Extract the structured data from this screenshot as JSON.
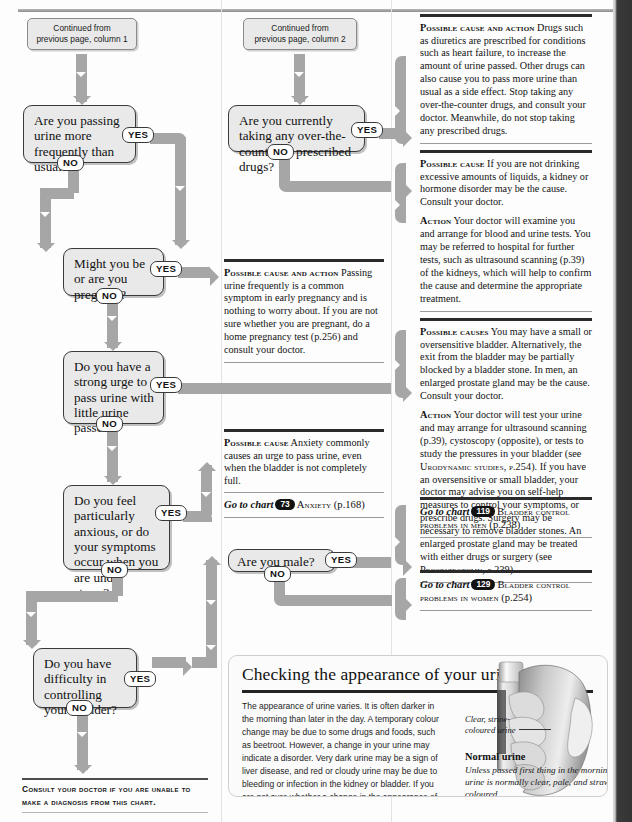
{
  "page": {
    "footer_note_line1": "Consult your doctor if you are unable to",
    "footer_note_line2": "make a diagnosis from this chart."
  },
  "continued": [
    {
      "name": "continued-column-1",
      "line1": "Continued from",
      "line2": "previous page, column 1"
    },
    {
      "name": "continued-column-2",
      "line1": "Continued from",
      "line2": "previous page, column 2"
    }
  ],
  "questions": [
    {
      "id": "q-frequency",
      "text": "Are you passing urine more frequently than usual?",
      "yes": "YES",
      "no": "NO"
    },
    {
      "id": "q-drugs",
      "text": "Are you currently taking any over-the-counter or prescribed drugs?",
      "yes": "YES",
      "no": "NO"
    },
    {
      "id": "q-pregnant",
      "text": "Might you be or are you pregnant?",
      "yes": "YES",
      "no": "NO"
    },
    {
      "id": "q-urge",
      "text": "Do you have a strong urge to pass urine with little urine passed?",
      "yes": "YES",
      "no": "NO"
    },
    {
      "id": "q-anxious",
      "text": "Do you feel particularly anxious, or do your symptoms occur when you are under stress?",
      "yes": "YES",
      "no": "NO"
    },
    {
      "id": "q-male",
      "text": "Are you male?",
      "yes": "YES",
      "no": "NO"
    },
    {
      "id": "q-bladder-control",
      "text": "Do you have difficulty in controlling your bladder?",
      "yes": "YES",
      "no": "NO"
    }
  ],
  "advice": {
    "drugs": {
      "label": "Possible cause and action",
      "body": "Drugs such as diuretics are prescribed for conditions such as heart failure, to increase the amount of urine passed. Other drugs can also cause you to pass more urine than usual as a side effect. Stop taking any over-the-counter drugs, and consult your doctor. Meanwhile, do not stop taking any prescribed drugs."
    },
    "kidney": {
      "label": "Possible cause",
      "body": "If you are not drinking excessive amounts of liquids, a kidney or hormone disorder may be the cause. Consult your doctor.",
      "action_label": "Action",
      "action_body": "Your doctor will examine you and arrange for blood and urine tests. You may be referred to hospital for further tests, such as ultrasound scanning (p.39) of the kidneys, which will help to confirm the cause and determine the appropriate treatment."
    },
    "pregnancy": {
      "label": "Possible cause and action",
      "body": "Passing urine frequently is a common symptom in early pregnancy and is nothing to worry about. If you are not sure whether you are pregnant, do a home pregnancy test (p.256) and consult your doctor."
    },
    "bladder": {
      "label": "Possible causes",
      "body": "You may have a small or oversensitive bladder. Alternatively, the exit from the bladder may be partially blocked by a bladder stone. In men, an enlarged prostate gland may be the cause. Consult your doctor.",
      "action_label": "Action",
      "action_body_1": "Your doctor will test your urine and may arrange for ultrasound scanning (p.39), cystoscopy (opposite), or tests to study the pressures in your bladder (see ",
      "action_ref_1": "Urodynamic studies, p.254",
      "action_body_2": "). If you have an oversensitive or small bladder, your doctor may advise you on self-help measures to control your symptoms, or prescribe drugs. Surgery may be necessary to remove bladder stones. An enlarged prostate gland may be treated with either drugs or surgery (see ",
      "action_ref_2": "Prostatectomy, p.239",
      "action_body_3": ")."
    },
    "anxiety": {
      "label": "Possible cause",
      "body": "Anxiety commonly causes an urge to pass urine, even when the bladder is not completely full."
    }
  },
  "goto": [
    {
      "id": "goto-anxiety",
      "lead": "Go to chart",
      "number": "73",
      "title": "Anxiety",
      "page": "(p.168)"
    },
    {
      "id": "goto-bladder-men",
      "lead": "Go to chart",
      "number": "119",
      "title": "Bladder control problems in men",
      "page": "(p.238)"
    },
    {
      "id": "goto-bladder-women",
      "lead": "Go to chart",
      "number": "129",
      "title": "Bladder control problems in women",
      "page": "(p.254)"
    }
  ],
  "infobox": {
    "title": "Checking the appearance of your urine",
    "body": "The appearance of urine varies. It is often darker in the morning than later in the day. A temporary colour change may be due to some drugs and foods, such as beetroot. However, a change in your urine may indicate a disorder. Very dark urine may be a sign of liver disease, and red or cloudy urine may be due to bleeding or infection in the kidney or bladder. If you are not sure whether a change in the appearance of your urine is normal, consult your doctor.",
    "leader_caption_line1": "Clear, straw-",
    "leader_caption_line2": "coloured urine",
    "caption_title": "Normal urine",
    "caption_text": "Unless passed first thing in the morning, urine is normally clear, pale, and straw-coloured."
  },
  "colors": {
    "connector": "#a6a6a6",
    "box_fill": "#e9e9e9",
    "box_border": "#3a3a3a",
    "rule_dark": "#2a2a2a",
    "binding": "#333333"
  }
}
